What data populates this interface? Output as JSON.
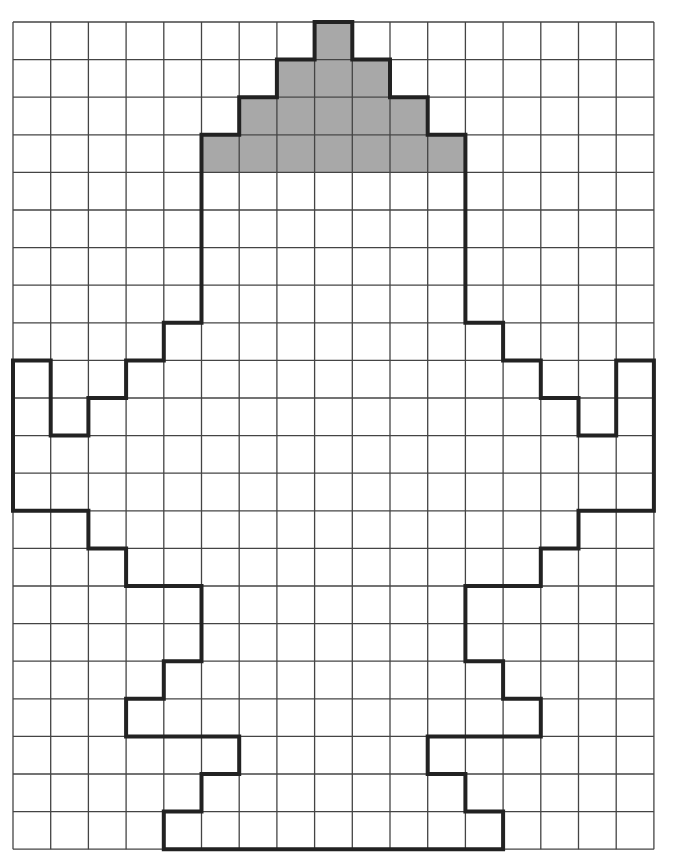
{
  "grid": {
    "columns": 17,
    "rows": 22,
    "origin_x": 13,
    "origin_y": 22,
    "cell_width": 37.7,
    "cell_height": 37.6,
    "line_color": "#444444",
    "line_width": 1.3,
    "background": "#ffffff"
  },
  "shaded_region": {
    "fill": "#a8a8a8",
    "cells_by_row": [
      {
        "row": 0,
        "from_col": 8,
        "to_col": 8
      },
      {
        "row": 1,
        "from_col": 7,
        "to_col": 9
      },
      {
        "row": 2,
        "from_col": 6,
        "to_col": 10
      },
      {
        "row": 3,
        "from_col": 5,
        "to_col": 11
      }
    ]
  },
  "outline": {
    "stroke": "#222222",
    "stroke_width": 4,
    "points": [
      [
        8,
        0
      ],
      [
        9,
        0
      ],
      [
        9,
        1
      ],
      [
        10,
        1
      ],
      [
        10,
        2
      ],
      [
        11,
        2
      ],
      [
        11,
        3
      ],
      [
        12,
        3
      ],
      [
        12,
        8
      ],
      [
        13,
        8
      ],
      [
        13,
        9
      ],
      [
        14,
        9
      ],
      [
        14,
        10
      ],
      [
        15,
        10
      ],
      [
        15,
        11
      ],
      [
        16,
        11
      ],
      [
        16,
        9
      ],
      [
        17,
        9
      ],
      [
        17,
        13
      ],
      [
        15,
        13
      ],
      [
        15,
        14
      ],
      [
        14,
        14
      ],
      [
        14,
        15
      ],
      [
        12,
        15
      ],
      [
        12,
        17
      ],
      [
        13,
        17
      ],
      [
        13,
        18
      ],
      [
        14,
        18
      ],
      [
        14,
        19
      ],
      [
        11,
        19
      ],
      [
        11,
        20
      ],
      [
        12,
        20
      ],
      [
        12,
        21
      ],
      [
        13,
        21
      ],
      [
        13,
        22
      ],
      [
        4,
        22
      ],
      [
        4,
        21
      ],
      [
        5,
        21
      ],
      [
        5,
        20
      ],
      [
        6,
        20
      ],
      [
        6,
        19
      ],
      [
        3,
        19
      ],
      [
        3,
        18
      ],
      [
        4,
        18
      ],
      [
        4,
        17
      ],
      [
        5,
        17
      ],
      [
        5,
        15
      ],
      [
        3,
        15
      ],
      [
        3,
        14
      ],
      [
        2,
        14
      ],
      [
        2,
        13
      ],
      [
        0,
        13
      ],
      [
        0,
        9
      ],
      [
        1,
        9
      ],
      [
        1,
        11
      ],
      [
        2,
        11
      ],
      [
        2,
        10
      ],
      [
        3,
        10
      ],
      [
        3,
        9
      ],
      [
        4,
        9
      ],
      [
        4,
        8
      ],
      [
        5,
        8
      ],
      [
        5,
        3
      ],
      [
        6,
        3
      ],
      [
        6,
        2
      ],
      [
        7,
        2
      ],
      [
        7,
        1
      ],
      [
        8,
        1
      ]
    ]
  }
}
